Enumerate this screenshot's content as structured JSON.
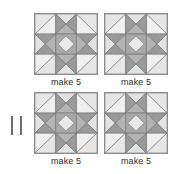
{
  "page": {
    "background_color": "#ffffff"
  },
  "pair_mark": {
    "symbol": "||",
    "name": "double-tick-mark",
    "color": "#6e6e6e"
  },
  "palette": {
    "outline": "#6b6b6b",
    "block_border": "#8d8d8d",
    "lightest": "#efefef",
    "light": "#e2e2e2",
    "mid_light": "#d2d2d2",
    "mid": "#b4b4b4",
    "mid_dark": "#9a9a9a",
    "dark": "#8a8a8a",
    "darkest": "#777777",
    "text": "#2b2b2b"
  },
  "blocks": [
    {
      "id": "block-top-left",
      "position": "top-left",
      "caption": "make 5",
      "pattern": "star-in-square-with-diamond-center"
    },
    {
      "id": "block-top-right",
      "position": "top-right",
      "caption": "make 5",
      "pattern": "star-in-square-with-diamond-center"
    },
    {
      "id": "block-bottom-left",
      "position": "bottom-left",
      "caption": "make 5",
      "pattern": "star-in-square-with-diamond-center"
    },
    {
      "id": "block-bottom-right",
      "position": "bottom-right",
      "caption": "make 5",
      "pattern": "star-in-square-with-diamond-center"
    }
  ]
}
